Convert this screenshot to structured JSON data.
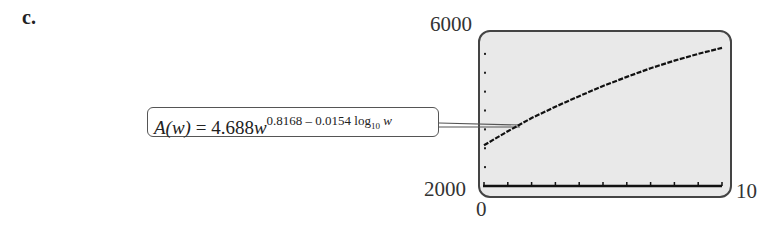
{
  "part_label": "c.",
  "callout": {
    "lhs": "A(w)",
    "equals": " = 4.688",
    "base": "w",
    "exponent": "0.8168 – 0.0154 log",
    "log_base": "10",
    "exponent_var": "w"
  },
  "axes": {
    "y_max_label": "6000",
    "y_min_label": "2000",
    "x_min_label": "0",
    "x_max_label": "10"
  },
  "chart_data": {
    "type": "line",
    "title": "",
    "xlabel": "",
    "ylabel": "",
    "xlim": [
      0,
      10
    ],
    "ylim": [
      2000,
      6000
    ],
    "x_ticks": [
      0,
      1,
      2,
      3,
      4,
      5,
      6,
      7,
      8,
      9,
      10
    ],
    "y_ticks": [
      2000,
      2500,
      3000,
      3500,
      4000,
      4500,
      5000,
      5500,
      6000
    ],
    "grid": false,
    "legend": [],
    "annotation": "A(w) = 4.688w^(0.8168 - 0.0154 log10 w)",
    "series": [
      {
        "name": "A(w)",
        "x": [
          0,
          1,
          2,
          3,
          4,
          5,
          6,
          7,
          8,
          9,
          10
        ],
        "y": [
          3080,
          3450,
          3800,
          4100,
          4380,
          4650,
          4890,
          5120,
          5320,
          5500,
          5660
        ]
      }
    ]
  }
}
